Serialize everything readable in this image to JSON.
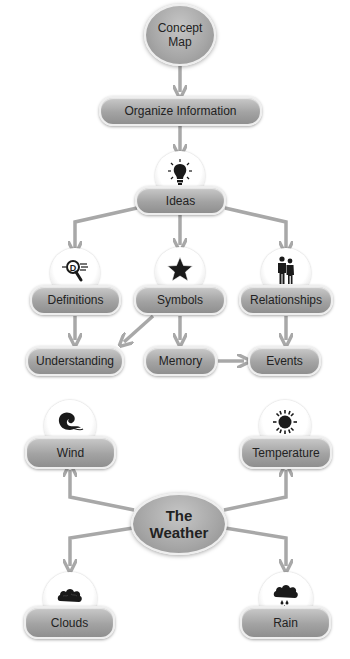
{
  "diagram": {
    "colors": {
      "arrow": "#a8a8a8",
      "node_fill_top": "#c9c9c9",
      "node_fill_bottom": "#8f8f8f",
      "node_border": "#eeeeee",
      "icon": "#1a1a1a",
      "text": "#222222",
      "background": "#ffffff"
    },
    "top": {
      "root": {
        "line1": "Concept",
        "line2": "Map"
      },
      "organize": {
        "label": "Organize Information"
      },
      "ideas": {
        "label": "Ideas",
        "icon": "lightbulb-icon"
      },
      "definitions": {
        "label": "Definitions",
        "icon": "magnifier-d-icon"
      },
      "symbols": {
        "label": "Symbols",
        "icon": "star-icon"
      },
      "relationships": {
        "label": "Relationships",
        "icon": "couple-icon"
      },
      "understanding": {
        "label": "Understanding"
      },
      "memory": {
        "label": "Memory"
      },
      "events": {
        "label": "Events"
      }
    },
    "bottom": {
      "root": {
        "line1": "The",
        "line2": "Weather"
      },
      "wind": {
        "label": "Wind",
        "icon": "wind-icon"
      },
      "temperature": {
        "label": "Temperature",
        "icon": "sun-icon"
      },
      "clouds": {
        "label": "Clouds",
        "icon": "cloud-icon"
      },
      "rain": {
        "label": "Rain",
        "icon": "rain-cloud-icon"
      }
    },
    "edges": [
      {
        "from": "Concept Map",
        "to": "Organize Information"
      },
      {
        "from": "Organize Information",
        "to": "Ideas"
      },
      {
        "from": "Ideas",
        "to": "Definitions"
      },
      {
        "from": "Ideas",
        "to": "Symbols"
      },
      {
        "from": "Ideas",
        "to": "Relationships"
      },
      {
        "from": "Definitions",
        "to": "Understanding"
      },
      {
        "from": "Symbols",
        "to": "Understanding"
      },
      {
        "from": "Symbols",
        "to": "Memory"
      },
      {
        "from": "Relationships",
        "to": "Events"
      },
      {
        "from": "Memory",
        "to": "Events"
      },
      {
        "from": "The Weather",
        "to": "Wind"
      },
      {
        "from": "The Weather",
        "to": "Temperature"
      },
      {
        "from": "The Weather",
        "to": "Clouds"
      },
      {
        "from": "The Weather",
        "to": "Rain"
      }
    ]
  }
}
